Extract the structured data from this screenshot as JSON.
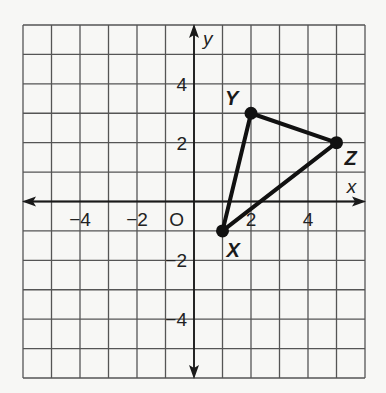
{
  "chart_data": {
    "type": "scatter",
    "title": "",
    "xlabel": "x",
    "ylabel": "y",
    "xlim": [
      -6,
      6
    ],
    "ylim": [
      -6,
      6
    ],
    "grid": true,
    "origin_label": "O",
    "x_ticks": [
      {
        "value": -4,
        "label": "−4"
      },
      {
        "value": -2,
        "label": "−2"
      },
      {
        "value": 2,
        "label": "2"
      },
      {
        "value": 4,
        "label": "4"
      }
    ],
    "y_ticks": [
      {
        "value": 4,
        "label": "4"
      },
      {
        "value": 2,
        "label": "2"
      },
      {
        "value": -2,
        "label": "−2"
      },
      {
        "value": -4,
        "label": "−4"
      }
    ],
    "points": [
      {
        "name": "X",
        "x": 1,
        "y": -1
      },
      {
        "name": "Y",
        "x": 2,
        "y": 3
      },
      {
        "name": "Z",
        "x": 5,
        "y": 2
      }
    ],
    "polygon": [
      "X",
      "Y",
      "Z"
    ],
    "colors": {
      "grid": "#555555",
      "line": "#111111",
      "background": "#f7f7f5"
    }
  }
}
